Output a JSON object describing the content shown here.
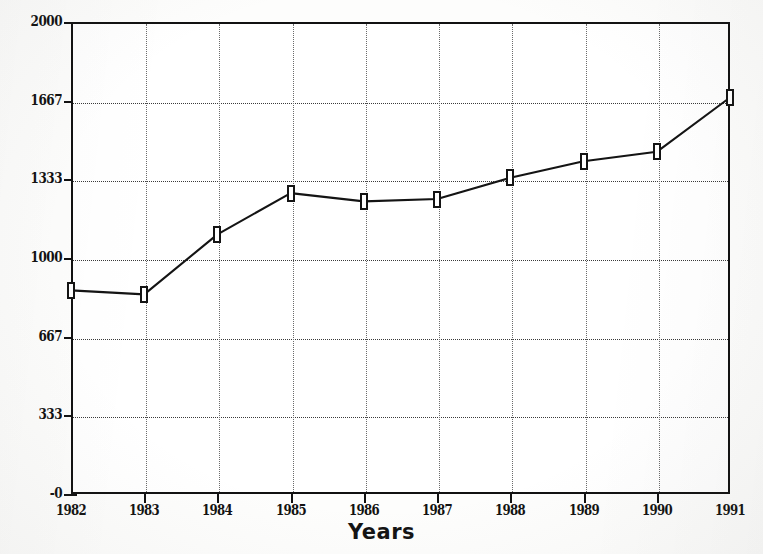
{
  "chart_data": {
    "type": "line",
    "title": "",
    "xlabel": "Years",
    "ylabel": "",
    "categories": [
      "1982",
      "1983",
      "1984",
      "1985",
      "1986",
      "1987",
      "1988",
      "1989",
      "1990",
      "1991"
    ],
    "values": [
      863,
      846,
      1100,
      1275,
      1240,
      1250,
      1340,
      1410,
      1450,
      1680
    ],
    "series": [
      {
        "name": "",
        "values": [
          863,
          846,
          1100,
          1275,
          1240,
          1250,
          1340,
          1410,
          1450,
          1680
        ]
      }
    ],
    "ylim": [
      0,
      2000
    ],
    "yticks": [
      "-0",
      "333",
      "667",
      "1000",
      "1333",
      "1667",
      "2000"
    ],
    "ytick_values": [
      0,
      333,
      667,
      1000,
      1333,
      1667,
      2000
    ],
    "xticks": [
      "1982",
      "1983",
      "1984",
      "1985",
      "1986",
      "1987",
      "1988",
      "1989",
      "1990",
      "1991"
    ],
    "grid": true,
    "grid_style": "dotted",
    "legend": "none",
    "marker": "open-rectangle",
    "line_color": "#141414",
    "marker_fill": "#ffffff",
    "marker_border": "#141414",
    "axis_color": "#111111",
    "background_color": "#ffffff"
  },
  "axes": {
    "x_title": "Years"
  }
}
